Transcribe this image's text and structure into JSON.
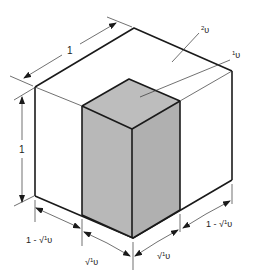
{
  "figure": {
    "colors": {
      "edge": "#1a1a1a",
      "inner_fill": "#bdbdbd",
      "inner_side_fill": "#b3b3b3",
      "outer_fill": "#ffffff"
    },
    "labels": {
      "outer_region": "²υ",
      "outer_region_sup": "2",
      "outer_region_base": "υ",
      "inner_region": "¹υ",
      "inner_region_sup": "1",
      "inner_region_base": "υ",
      "top_depth": "1",
      "height": "1",
      "bottom_left_outer": "1 - √¹υ",
      "bottom_left_inner": "√¹υ",
      "bottom_right_inner": "√¹υ",
      "bottom_right_outer": "1 - √¹υ"
    },
    "label_parts": {
      "one_minus": "1 - ",
      "sqrt": "√",
      "sup1": "1",
      "upsilon": "υ"
    }
  }
}
